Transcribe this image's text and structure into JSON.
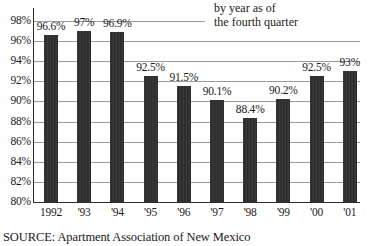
{
  "caption": "by year as of\nthe fourth quarter",
  "source": "SOURCE: Apartment Association of New Mexico",
  "chart_data": {
    "type": "bar",
    "title": "",
    "subtitle": "by year as of the fourth quarter",
    "xlabel": "",
    "ylabel": "",
    "ylim": [
      80,
      98
    ],
    "ytick_step": 2,
    "grid": true,
    "legend": null,
    "bar_color": "#2e2e2e",
    "value_suffix": "%",
    "categories": [
      "1992",
      "'93",
      "'94",
      "'95",
      "'96",
      "'97",
      "'98",
      "'99",
      "'00",
      "'01"
    ],
    "values": [
      96.6,
      97,
      96.9,
      92.5,
      91.5,
      90.1,
      88.4,
      90.2,
      92.5,
      93
    ],
    "value_labels": [
      "96.6%",
      "97%",
      "96.9%",
      "92.5%",
      "91.5%",
      "90.1%",
      "88.4%",
      "90.2%",
      "92.5%",
      "93%"
    ],
    "ytick_labels": [
      "98%",
      "96%",
      "94%",
      "92%",
      "90%",
      "88%",
      "86%",
      "84%",
      "82%",
      "80%"
    ],
    "ytick_values": [
      98,
      96,
      94,
      92,
      90,
      88,
      86,
      84,
      82,
      80
    ]
  }
}
